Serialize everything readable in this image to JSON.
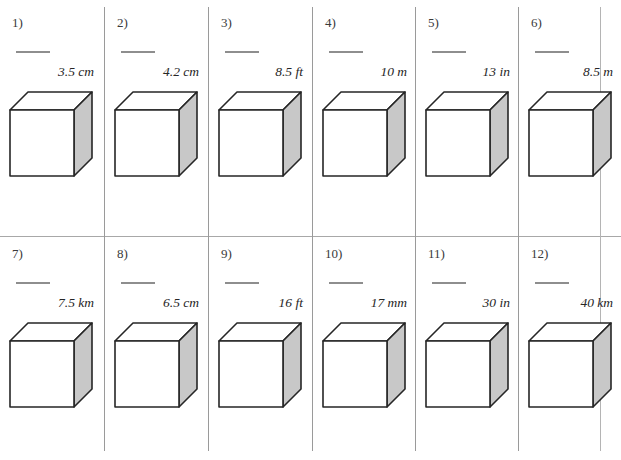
{
  "worksheet": {
    "title": "",
    "title_visible_fragment": "",
    "columns": 6,
    "rows": 2,
    "total_items": 12,
    "colors": {
      "page_background": "#ffffff",
      "rule": "#9a9a9a",
      "cube_outline": "#262626",
      "cube_front_face": "#ffffff",
      "cube_top_face": "#ffffff",
      "cube_side_face": "#c8c8c8",
      "answer_blank": "#8e8e8e",
      "number_text": "#3a3a3a",
      "label_text": "#262626"
    }
  },
  "dividers": {
    "vertical_x": [
      104,
      208,
      312,
      415,
      518,
      600
    ],
    "horizontal_y": [
      236
    ]
  },
  "items": [
    {
      "number": "1)",
      "label": "3.5 cm",
      "value": "3.5",
      "unit": "cm",
      "blank": ""
    },
    {
      "number": "2)",
      "label": "4.2 cm",
      "value": "4.2",
      "unit": "cm",
      "blank": ""
    },
    {
      "number": "3)",
      "label": "8.5 ft",
      "value": "8.5",
      "unit": "ft",
      "blank": ""
    },
    {
      "number": "4)",
      "label": "10 m",
      "value": "10",
      "unit": "m",
      "blank": ""
    },
    {
      "number": "5)",
      "label": "13 in",
      "value": "13",
      "unit": "in",
      "blank": ""
    },
    {
      "number": "6)",
      "label": "8.5 m",
      "value": "8.5",
      "unit": "m",
      "blank": ""
    },
    {
      "number": "7)",
      "label": "7.5 km",
      "value": "7.5",
      "unit": "km",
      "blank": ""
    },
    {
      "number": "8)",
      "label": "6.5 cm",
      "value": "6.5",
      "unit": "cm",
      "blank": ""
    },
    {
      "number": "9)",
      "label": "16 ft",
      "value": "16",
      "unit": "ft",
      "blank": ""
    },
    {
      "number": "10)",
      "label": "17 mm",
      "value": "17",
      "unit": "mm",
      "blank": ""
    },
    {
      "number": "11)",
      "label": "30 in",
      "value": "30",
      "unit": "in",
      "blank": ""
    },
    {
      "number": "12)",
      "label": "40 km",
      "value": "40",
      "unit": "km",
      "blank": ""
    }
  ],
  "cube_icon": {
    "name": "cube-diagram",
    "shape": "isometric-cube"
  }
}
